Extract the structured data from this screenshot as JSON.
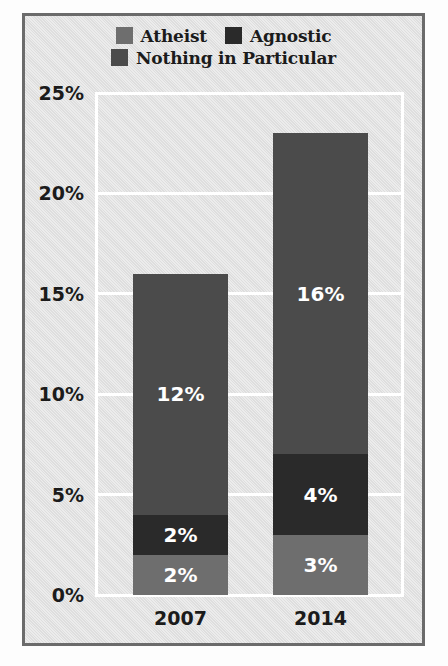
{
  "chart_data": {
    "type": "bar",
    "stacked": true,
    "title": "",
    "subtitle": "",
    "xlabel": "",
    "ylabel": "",
    "categories": [
      "2007",
      "2014"
    ],
    "series": [
      {
        "name": "Atheist",
        "values": [
          2,
          3
        ],
        "value_labels": [
          "2%",
          "3%"
        ],
        "color": "#6e6e6e"
      },
      {
        "name": "Agnostic",
        "values": [
          2,
          4
        ],
        "value_labels": [
          "2%",
          "4%"
        ],
        "color": "#2a2a2a"
      },
      {
        "name": "Nothing in Particular",
        "values": [
          12,
          16
        ],
        "value_labels": [
          "12%",
          "16%"
        ],
        "color": "#4b4b4b"
      }
    ],
    "totals": [
      16,
      23
    ],
    "ylim": [
      0,
      25
    ],
    "yticks": [
      0,
      5,
      10,
      15,
      20,
      25
    ],
    "ytick_labels": [
      "0%",
      "5%",
      "10%",
      "15%",
      "20%",
      "25%"
    ],
    "grid": true,
    "gridline_color": "#ffffff",
    "legend_position": "top",
    "plot_background": "#e2e2e2",
    "border_color": "#6b6b6b"
  },
  "legend": {
    "rows": [
      [
        {
          "label": "Atheist",
          "swatch_name": "legend-swatch-atheist",
          "color": "#6e6e6e"
        },
        {
          "label": "Agnostic",
          "swatch_name": "legend-swatch-agnostic",
          "color": "#2a2a2a"
        }
      ],
      [
        {
          "label": "Nothing in Particular",
          "swatch_name": "legend-swatch-nothing-in-particular",
          "color": "#4b4b4b"
        }
      ]
    ]
  },
  "axis": {
    "y_labels": [
      "25%",
      "20%",
      "15%",
      "10%",
      "5%",
      "0%"
    ],
    "x_labels": [
      "2007",
      "2014"
    ]
  },
  "bars": [
    {
      "category": "2007",
      "segments": [
        {
          "series": "Nothing in Particular",
          "label": "12%",
          "value": 12,
          "color": "#4b4b4b"
        },
        {
          "series": "Agnostic",
          "label": "2%",
          "value": 2,
          "color": "#2a2a2a"
        },
        {
          "series": "Atheist",
          "label": "2%",
          "value": 2,
          "color": "#6e6e6e"
        }
      ]
    },
    {
      "category": "2014",
      "segments": [
        {
          "series": "Nothing in Particular",
          "label": "16%",
          "value": 16,
          "color": "#4b4b4b"
        },
        {
          "series": "Agnostic",
          "label": "4%",
          "value": 4,
          "color": "#2a2a2a"
        },
        {
          "series": "Atheist",
          "label": "3%",
          "value": 3,
          "color": "#6e6e6e"
        }
      ]
    }
  ]
}
